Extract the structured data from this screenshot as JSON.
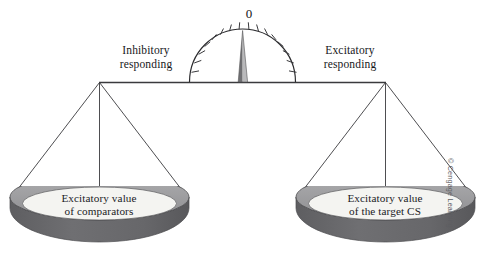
{
  "figure": {
    "background_color": "#ffffff"
  },
  "gauge": {
    "zero_label": "0",
    "needle_left_color": "#6f6f72",
    "needle_right_color": "#b9b9bb",
    "arc_color": "#2b2b2e",
    "tick_count": 22
  },
  "beam": {
    "color": "#3a3a3d",
    "left_label": {
      "line1": "Inhibitory",
      "line2": "responding"
    },
    "right_label": {
      "line1": "Excitatory",
      "line2": "responding"
    }
  },
  "pans": [
    {
      "side": "left",
      "label_line1": "Excitatory value",
      "label_line2": "of comparators",
      "rim_color": "#a0a0a2",
      "body_color": "#6a6a6d",
      "inner_color": "#f4f4f1"
    },
    {
      "side": "right",
      "label_line1": "Excitatory value",
      "label_line2": "of the target CS",
      "rim_color": "#a0a0a2",
      "body_color": "#6a6a6d",
      "inner_color": "#f4f4f1"
    }
  ],
  "credit": {
    "text": "© Cengage Learning"
  }
}
